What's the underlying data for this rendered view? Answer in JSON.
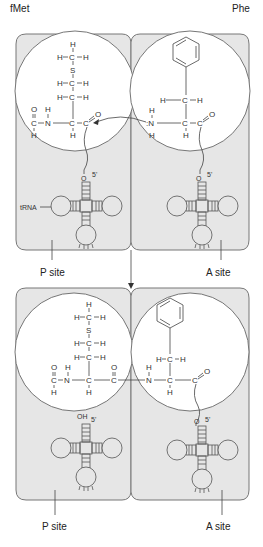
{
  "top": {
    "left_label": "fMet",
    "right_label": "Phe",
    "trna_label": "tRNA",
    "p_site": "P site",
    "a_site": "A site",
    "left_molecule": {
      "atoms": [
        "H",
        "H",
        "C",
        "H",
        "S",
        "H",
        "C",
        "H",
        "H",
        "C",
        "H",
        "O",
        "H",
        "C",
        "N",
        "C",
        "C",
        "O",
        "H",
        "H"
      ],
      "end": "O",
      "prime": "5'"
    },
    "right_molecule": {
      "atoms": [
        "H",
        "C",
        "H",
        "H",
        "N",
        "H",
        "C",
        "C",
        "O",
        "H"
      ],
      "end": "O",
      "prime": "5'"
    }
  },
  "bottom": {
    "p_site": "P site",
    "a_site": "A site",
    "left_end": "OH",
    "right_end": "O",
    "prime": "5'",
    "peptide_bond": "C-N"
  },
  "colors": {
    "panel": "#e6e6e6",
    "circle": "#ffffff",
    "stroke": "#666666"
  }
}
